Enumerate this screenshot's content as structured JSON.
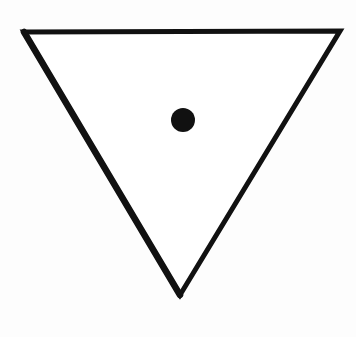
{
  "figure": {
    "title": "Downward-pointing triangle with central dot",
    "background_color": "#fdfdfd",
    "stroke_color": "#111111",
    "fill_color": "#ffffff"
  },
  "triangle": {
    "vertices": {
      "top_left": [
        24,
        32
      ],
      "top_right": [
        340,
        31
      ],
      "bottom": [
        180,
        295
      ]
    },
    "stroke_width": 5
  },
  "dot": {
    "cx": 183,
    "cy": 120,
    "r": 12,
    "color": "#111111"
  }
}
